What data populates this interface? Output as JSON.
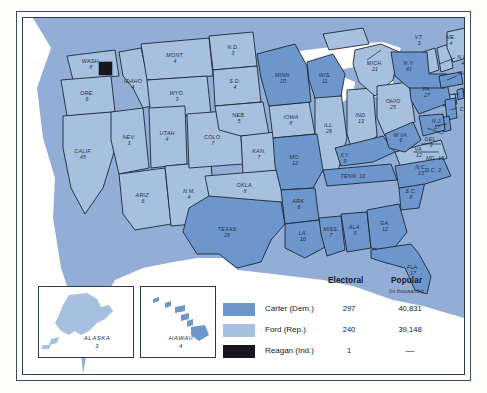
{
  "colors": {
    "carter": "#6d96cc",
    "ford": "#a8c0e0",
    "reagan": "#17161c",
    "ocean": "#93aed6",
    "land_border": "#1b2736",
    "page_background": "#ffffff",
    "frame": "#2d3a4d"
  },
  "legend": {
    "header_electoral": "Electoral",
    "header_popular": "Popular",
    "header_popular_note": "(in thousands)",
    "rows": [
      {
        "name": "Carter (Dem.)",
        "electoral": "297",
        "popular": "40,831",
        "swatch": "carter"
      },
      {
        "name": "Ford (Rep.)",
        "electoral": "240",
        "popular": "39,148",
        "swatch": "ford"
      },
      {
        "name": "Reagan (Ind.)",
        "electoral": "1",
        "popular": "—",
        "swatch": "reagan"
      }
    ]
  },
  "insets": [
    {
      "name": "ALASKA",
      "electoral": "3",
      "winner": "ford"
    },
    {
      "name": "HAWAII",
      "electoral": "4",
      "winner": "carter"
    }
  ],
  "states": [
    {
      "abbr": "WASH.",
      "ev": "8",
      "winner": "ford"
    },
    {
      "abbr": "ORE.",
      "ev": "6",
      "winner": "ford"
    },
    {
      "abbr": "CALIF.",
      "ev": "45",
      "winner": "ford"
    },
    {
      "abbr": "NEV.",
      "ev": "3",
      "winner": "ford"
    },
    {
      "abbr": "IDAHO",
      "ev": "4",
      "winner": "ford"
    },
    {
      "abbr": "MONT.",
      "ev": "4",
      "winner": "ford"
    },
    {
      "abbr": "WYO.",
      "ev": "3",
      "winner": "ford"
    },
    {
      "abbr": "UTAH",
      "ev": "4",
      "winner": "ford"
    },
    {
      "abbr": "ARIZ.",
      "ev": "6",
      "winner": "ford"
    },
    {
      "abbr": "N.M.",
      "ev": "4",
      "winner": "ford"
    },
    {
      "abbr": "COLO.",
      "ev": "7",
      "winner": "ford"
    },
    {
      "abbr": "N.D.",
      "ev": "3",
      "winner": "ford"
    },
    {
      "abbr": "S.D.",
      "ev": "4",
      "winner": "ford"
    },
    {
      "abbr": "NEB.",
      "ev": "5",
      "winner": "ford"
    },
    {
      "abbr": "KAN.",
      "ev": "7",
      "winner": "ford"
    },
    {
      "abbr": "OKLA.",
      "ev": "8",
      "winner": "ford"
    },
    {
      "abbr": "TEXAS",
      "ev": "26",
      "winner": "carter"
    },
    {
      "abbr": "MINN.",
      "ev": "10",
      "winner": "carter"
    },
    {
      "abbr": "IOWA",
      "ev": "8",
      "winner": "ford"
    },
    {
      "abbr": "MO.",
      "ev": "12",
      "winner": "carter"
    },
    {
      "abbr": "ARK.",
      "ev": "6",
      "winner": "carter"
    },
    {
      "abbr": "LA.",
      "ev": "10",
      "winner": "carter"
    },
    {
      "abbr": "WIS.",
      "ev": "11",
      "winner": "carter"
    },
    {
      "abbr": "ILL.",
      "ev": "26",
      "winner": "ford"
    },
    {
      "abbr": "MICH.",
      "ev": "21",
      "winner": "ford"
    },
    {
      "abbr": "IND.",
      "ev": "13",
      "winner": "ford"
    },
    {
      "abbr": "OHIO",
      "ev": "25",
      "winner": "ford"
    },
    {
      "abbr": "KY.",
      "ev": "9",
      "winner": "carter"
    },
    {
      "abbr": "TENN.",
      "ev": "10",
      "winner": "carter"
    },
    {
      "abbr": "MISS.",
      "ev": "7",
      "winner": "carter"
    },
    {
      "abbr": "ALA.",
      "ev": "9",
      "winner": "carter"
    },
    {
      "abbr": "GA.",
      "ev": "12",
      "winner": "carter"
    },
    {
      "abbr": "FLA.",
      "ev": "17",
      "winner": "carter"
    },
    {
      "abbr": "S.C.",
      "ev": "8",
      "winner": "carter"
    },
    {
      "abbr": "N.C.",
      "ev": "13",
      "winner": "carter"
    },
    {
      "abbr": "VA.",
      "ev": "12",
      "winner": "ford"
    },
    {
      "abbr": "W.VA.",
      "ev": "6",
      "winner": "carter"
    },
    {
      "abbr": "PA.",
      "ev": "27",
      "winner": "carter"
    },
    {
      "abbr": "N.Y.",
      "ev": "41",
      "winner": "carter"
    },
    {
      "abbr": "VT.",
      "ev": "3",
      "winner": "ford"
    },
    {
      "abbr": "N.H.",
      "ev": "4",
      "winner": "ford"
    },
    {
      "abbr": "ME.",
      "ev": "4",
      "winner": "ford"
    },
    {
      "abbr": "MASS.",
      "ev": "14",
      "winner": "carter"
    },
    {
      "abbr": "R.I.",
      "ev": "4",
      "winner": "carter"
    },
    {
      "abbr": "CONN.",
      "ev": "8",
      "winner": "ford"
    },
    {
      "abbr": "N.J.",
      "ev": "17",
      "winner": "carter"
    },
    {
      "abbr": "DEL.",
      "ev": "3",
      "winner": "carter"
    },
    {
      "abbr": "MD.",
      "ev": "10",
      "winner": "carter"
    },
    {
      "abbr": "D.C.",
      "ev": "3",
      "winner": "carter"
    }
  ]
}
